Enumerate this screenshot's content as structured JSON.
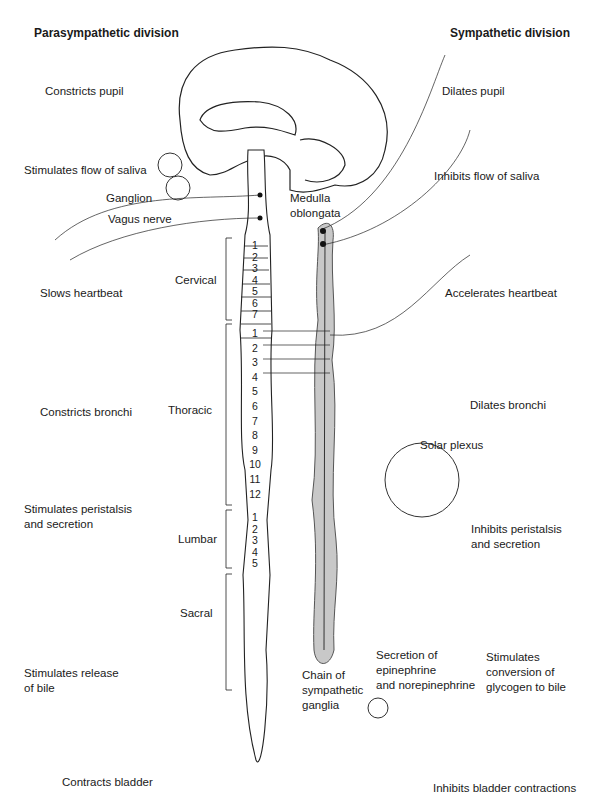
{
  "titles": {
    "left": "Parasympathetic division",
    "right": "Sympathetic division"
  },
  "parasympathetic": [
    "Constricts pupil",
    "Stimulates flow of saliva",
    "Slows heartbeat",
    "Constricts bronchi",
    "Stimulates peristalsis",
    "and secretion",
    "Stimulates release",
    "of bile",
    "Contracts bladder"
  ],
  "sympathetic": [
    "Dilates pupil",
    "Inhibits flow of saliva",
    "Accelerates heartbeat",
    "Dilates bronchi",
    "Inhibits peristalsis",
    "and secretion",
    "Secretion of",
    "epinephrine",
    "and norepinephrine",
    "Stimulates",
    "conversion of",
    "glycogen to bile",
    "Inhibits bladder contractions"
  ],
  "structures": {
    "ganglion": "Ganglion",
    "vagus": "Vagus nerve",
    "medulla1": "Medulla",
    "medulla2": "oblongata",
    "solar": "Solar plexus",
    "chain1": "Chain of",
    "chain2": "sympathetic",
    "chain3": "ganglia"
  },
  "regions": {
    "cervical": "Cervical",
    "thoracic": "Thoracic",
    "lumbar": "Lumbar",
    "sacral": "Sacral"
  },
  "segments": {
    "cervical": [
      "1",
      "2",
      "3",
      "4",
      "5",
      "6",
      "7"
    ],
    "thoracic": [
      "1",
      "2",
      "3",
      "4",
      "5",
      "6",
      "7",
      "8",
      "9",
      "10",
      "11",
      "12"
    ],
    "lumbar": [
      "1",
      "2",
      "3",
      "4",
      "5"
    ]
  },
  "colors": {
    "ink": "#1a1a1a",
    "chain": "#c8c8c8"
  }
}
